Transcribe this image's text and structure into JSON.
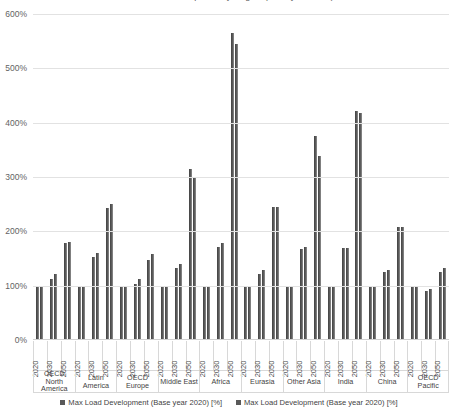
{
  "chart_data": {
    "type": "bar",
    "title": "Max Load Development by Region (Base year 2020)",
    "xlabel": "",
    "ylabel": "",
    "ylim": [
      0,
      600
    ],
    "ytick_step": 100,
    "ytick_labels": [
      "600%",
      "500%",
      "400%",
      "300%",
      "200%",
      "100%",
      "0%"
    ],
    "grid": true,
    "legend_position": "bottom",
    "bar_color": "#595959",
    "regions": [
      "OECD North America",
      "Latin America",
      "OECD Europe",
      "Middle East",
      "Africa",
      "Eurasia",
      "Other Asia",
      "India",
      "China",
      "OECD Pacific"
    ],
    "years": [
      "2020",
      "2030",
      "2050"
    ],
    "categories": [
      "OECD North America 2020",
      "OECD North America 2030",
      "OECD North America 2050",
      "Latin America 2020",
      "Latin America 2030",
      "Latin America 2050",
      "OECD Europe 2020",
      "OECD Europe 2030",
      "OECD Europe 2050",
      "Middle East 2020",
      "Middle East 2030",
      "Middle East 2050",
      "Africa 2020",
      "Africa 2030",
      "Africa 2050",
      "Eurasia 2020",
      "Eurasia 2030",
      "Eurasia 2050",
      "Other Asia 2020",
      "Other Asia 2030",
      "Other Asia 2050",
      "India 2020",
      "India 2030",
      "India 2050",
      "China 2020",
      "China 2030",
      "China 2050",
      "OECD Pacific 2020",
      "OECD Pacific 2030",
      "OECD Pacific 2050"
    ],
    "series": [
      {
        "name": "Max Load Development (Base year 2020) [%]",
        "color": "#595959",
        "values": [
          100,
          112,
          178,
          100,
          152,
          243,
          100,
          103,
          147,
          100,
          133,
          315,
          100,
          172,
          565,
          100,
          122,
          245,
          100,
          168,
          375,
          100,
          170,
          422,
          100,
          126,
          208,
          100,
          90,
          126
        ]
      },
      {
        "name": "Max Load Development (Base year 2020) [%]",
        "color": "#5c5c5c",
        "values": [
          100,
          122,
          180,
          100,
          160,
          251,
          100,
          112,
          158,
          100,
          140,
          299,
          100,
          178,
          545,
          100,
          128,
          245,
          100,
          172,
          338,
          100,
          170,
          418,
          100,
          129,
          208,
          100,
          93,
          133
        ]
      }
    ]
  },
  "legend": {
    "items": [
      {
        "label": "Max Load Development (Base year 2020) [%]"
      },
      {
        "label": "Max Load Development (Base year 2020) [%]"
      }
    ]
  }
}
